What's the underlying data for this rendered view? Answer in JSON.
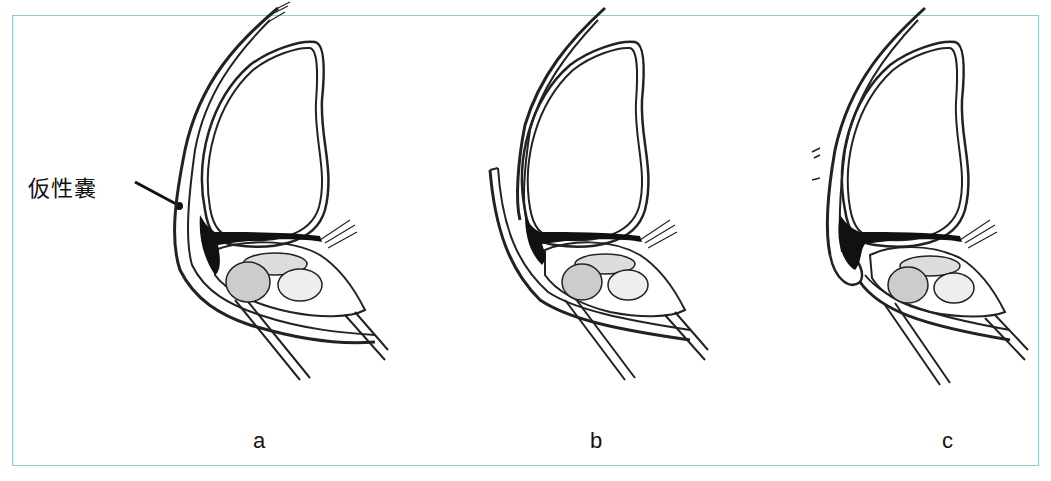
{
  "figure": {
    "callout_label": "仮性嚢",
    "border_color": "#8ccfcf",
    "panels": [
      {
        "id": "a",
        "label": "a",
        "variant": "pseudocapsule-intact"
      },
      {
        "id": "b",
        "label": "b",
        "variant": "capsule-separated"
      },
      {
        "id": "c",
        "label": "c",
        "variant": "capsule-sutured"
      }
    ]
  }
}
